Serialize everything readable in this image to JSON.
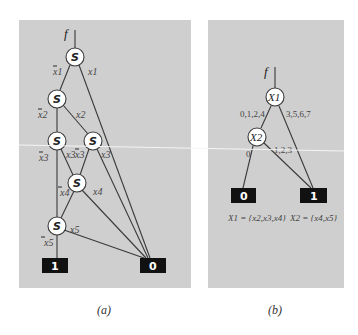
{
  "panel_a": {
    "root_label": "f",
    "node_label": "S",
    "edge_labels": {
      "n1_low": "x1",
      "n1_high": "x1",
      "n2_low": "x2",
      "n2_high": "x2",
      "n3_low": "x3",
      "n3_high": "x3",
      "n4_low": "x3",
      "n4_high": "x3",
      "n5_low": "x4",
      "n5_high": "x4",
      "n6_low": "x5",
      "n6_high": "x5"
    },
    "terminal_one": "1",
    "terminal_zero": "0",
    "caption": "(a)"
  },
  "panel_b": {
    "root_label": "f",
    "node_x1": "X1",
    "node_x2": "X2",
    "edge_x1_left": "0,1,2,4",
    "edge_x1_right": "3,5,6,7",
    "edge_x2_left": "0",
    "edge_x2_right": "1,2,3",
    "terminal_zero": "0",
    "terminal_one": "1",
    "set_x1": "X1 = {x2,x3,x4}",
    "set_x2": "X2 = {x4,x5}",
    "caption": "(b)"
  },
  "colors": {
    "panel_bg": "#cfcfcf",
    "terminal_bg": "#111111",
    "edge": "#3a3a3a"
  }
}
